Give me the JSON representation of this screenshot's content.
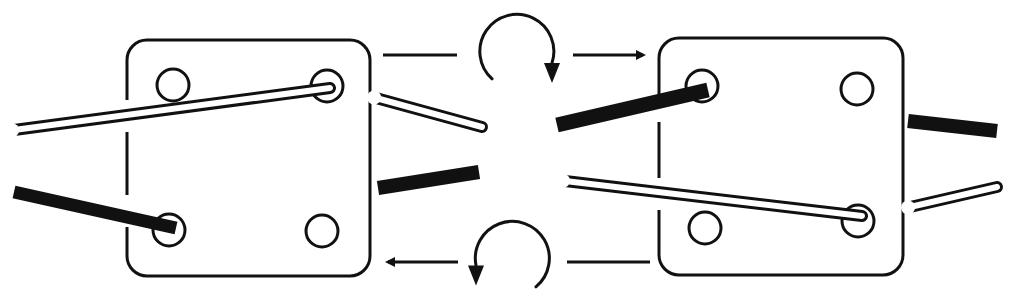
{
  "diagram": {
    "type": "tablet-weaving-turn-illustration",
    "colors": {
      "ink": "#111111",
      "background": "#ffffff",
      "white_cord": "#ffffff"
    },
    "cards": [
      {
        "id": "left-card",
        "rect": {
          "x": 127,
          "y": 40,
          "w": 243,
          "h": 236,
          "r": 20
        },
        "holes": [
          {
            "cx": 173,
            "cy": 85,
            "r": 16
          },
          {
            "cx": 327,
            "cy": 86,
            "r": 16
          },
          {
            "cx": 169,
            "cy": 230,
            "r": 16
          },
          {
            "cx": 322,
            "cy": 231,
            "r": 16
          }
        ],
        "edge_gaps": [
          {
            "y1": 100,
            "y2": 132
          },
          {
            "y1": 195,
            "y2": 227
          }
        ]
      },
      {
        "id": "right-card",
        "rect": {
          "x": 659,
          "y": 38,
          "w": 244,
          "h": 237,
          "r": 20
        },
        "holes": [
          {
            "cx": 702,
            "cy": 86,
            "r": 16
          },
          {
            "cx": 857,
            "cy": 89,
            "r": 16
          },
          {
            "cx": 705,
            "cy": 228,
            "r": 16
          },
          {
            "cx": 858,
            "cy": 221,
            "r": 16
          }
        ],
        "edge_gaps": [
          {
            "y1": 105,
            "y2": 122
          },
          {
            "y1": 178,
            "y2": 210
          }
        ]
      }
    ],
    "cords": {
      "left_white": {
        "from": [
          14,
          130
        ],
        "to": [
          330,
          88
        ],
        "width": 12
      },
      "left_black": {
        "from": [
          14,
          192
        ],
        "to": [
          176,
          228
        ],
        "width": 13
      },
      "mid_white": {
        "from": [
          376,
          98
        ],
        "to": [
          482,
          127
        ],
        "width": 12
      },
      "mid_black": {
        "from": [
          378,
          188
        ],
        "to": [
          479,
          172
        ],
        "width": 14
      },
      "right_black_in": {
        "from": [
          557,
          125
        ],
        "to": [
          708,
          90
        ],
        "width": 15
      },
      "right_white_in": {
        "from": [
          565,
          181
        ],
        "to": [
          862,
          216
        ],
        "width": 12
      },
      "far_right_black": {
        "from": [
          908,
          121
        ],
        "to": [
          997,
          131
        ],
        "width": 14
      },
      "far_right_white": {
        "from": [
          910,
          207
        ],
        "to": [
          997,
          187
        ],
        "width": 12
      }
    },
    "arrows": [
      {
        "id": "top-line-left",
        "kind": "line",
        "from": [
          383,
          55
        ],
        "to": [
          457,
          55
        ]
      },
      {
        "id": "top-rotate",
        "kind": "arc-clockwise",
        "cx": 515,
        "cy": 50,
        "r": 37
      },
      {
        "id": "top-arrow-right",
        "kind": "straight-arrow",
        "from": [
          573,
          55
        ],
        "to": [
          643,
          55
        ]
      },
      {
        "id": "bottom-arrow-left",
        "kind": "straight-arrow",
        "from": [
          458,
          262
        ],
        "to": [
          388,
          262
        ]
      },
      {
        "id": "bottom-rotate",
        "kind": "arc-counterclockwise",
        "cx": 513,
        "cy": 258,
        "r": 37
      },
      {
        "id": "bottom-line-right",
        "kind": "line",
        "from": [
          567,
          262
        ],
        "to": [
          650,
          262
        ]
      }
    ]
  }
}
